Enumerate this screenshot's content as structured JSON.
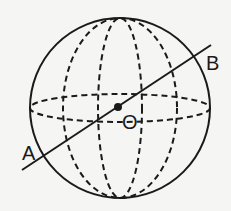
{
  "diagram": {
    "type": "sphere-with-diameter",
    "labels": {
      "point_a": "A",
      "point_b": "B",
      "center": "O"
    },
    "colors": {
      "stroke": "#1a1a1a",
      "background": "#f5f5f3"
    }
  }
}
